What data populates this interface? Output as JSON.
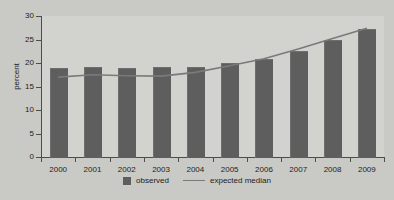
{
  "chart_data": {
    "type": "bar",
    "title": "",
    "subtitle": "",
    "xlabel": "",
    "ylabel": "percent",
    "categories": [
      "2000",
      "2001",
      "2002",
      "2003",
      "2004",
      "2005",
      "2006",
      "2007",
      "2008",
      "2009"
    ],
    "ylim": [
      0,
      30
    ],
    "y_ticks": [
      0,
      5,
      10,
      15,
      20,
      25,
      30
    ],
    "y_tick_labels": [
      "0",
      "5",
      "10",
      "15",
      "20",
      "25",
      "30"
    ],
    "grid": false,
    "legend_position": "bottom-center",
    "series": [
      {
        "name": "observed",
        "type": "bar",
        "color": "#5e5e5e",
        "values": [
          19.0,
          19.2,
          19.0,
          19.2,
          19.2,
          20.0,
          20.9,
          22.6,
          24.8,
          27.2
        ]
      },
      {
        "name": "expected median",
        "type": "line",
        "color": "#7a7a7a",
        "values": [
          17.0,
          17.5,
          17.3,
          17.2,
          18.0,
          19.4,
          20.9,
          23.0,
          25.2,
          27.4
        ]
      }
    ]
  },
  "legend": {
    "entries": [
      {
        "label": "observed",
        "marker": "bar-swatch"
      },
      {
        "label": "expected median",
        "marker": "line-swatch"
      }
    ]
  },
  "colors": {
    "background": "#c9c9c5",
    "plot_background": "#d2d2ce",
    "bar": "#5e5e5e",
    "line": "#7a7a7a",
    "axis": "#4c4c4c",
    "text": "#1d1d1d"
  }
}
